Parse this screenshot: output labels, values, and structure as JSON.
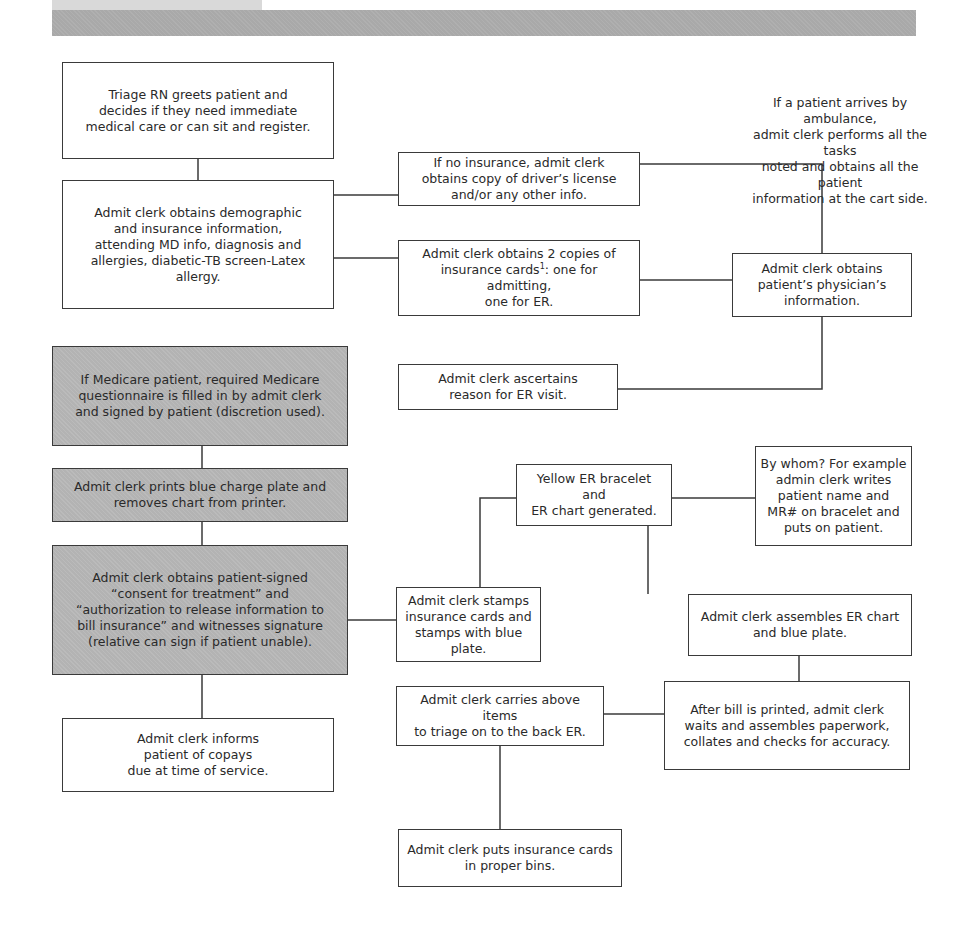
{
  "header": {
    "light_strip_color": "#d9d9d9",
    "band_color": "#a9a9a9"
  },
  "colors": {
    "shaded_box": "#b3b3b3",
    "border": "#3a3a3a",
    "text": "#2a2a2a"
  },
  "nodes": {
    "triage": "Triage RN greets patient and\ndecides if they need immediate\nmedical care or can sit and register.",
    "demographic": "Admit clerk obtains demographic\nand insurance information,\nattending MD info, diagnosis and\nallergies, diabetic-TB screen-Latex\nallergy.",
    "no_insurance": "If no insurance, admit clerk\nobtains copy of driver’s license\nand/or any other info.",
    "insurance_copies_pre": "Admit clerk obtains 2 copies of\ninsurance cards",
    "insurance_copies_sup": "1",
    "insurance_copies_post": ": one for admitting,\none for ER.",
    "ambulance_note": "If a patient arrives by ambulance,\nadmit clerk performs all the tasks\nnoted and obtains all the patient\ninformation at  the cart side.",
    "physician_info": "Admit clerk obtains\npatient’s physician’s\ninformation.",
    "ascertains_reason": "Admit clerk ascertains\nreason for ER visit.",
    "medicare": "If Medicare patient, required Medicare\nquestionnaire is filled in by admit clerk\nand signed by patient (discretion used).",
    "blue_plate": "Admit clerk prints blue charge plate and\nremoves chart from printer.",
    "consent": "Admit clerk obtains patient-signed\n“consent for treatment” and\n“authorization to release information to\nbill insurance” and witnesses signature\n(relative can sign if patient unable).",
    "copays": "Admit clerk informs\npatient of copays\ndue at time of service.",
    "yellow_bracelet": "Yellow ER bracelet and\nER chart generated.",
    "by_whom": "By whom? For example\nadmin clerk writes\npatient name and\nMR# on bracelet and\nputs on patient.",
    "stamps": "Admit clerk stamps\ninsurance cards and\nstamps with blue plate.",
    "assembles_chart": "Admit clerk assembles ER chart\nand blue plate.",
    "after_bill": "After bill is printed, admit clerk\nwaits and assembles paperwork,\ncollates and checks for accuracy.",
    "carries_items": "Admit clerk carries above items\nto triage on to the back ER.",
    "proper_bins": "Admit clerk puts insurance cards\nin proper bins."
  }
}
